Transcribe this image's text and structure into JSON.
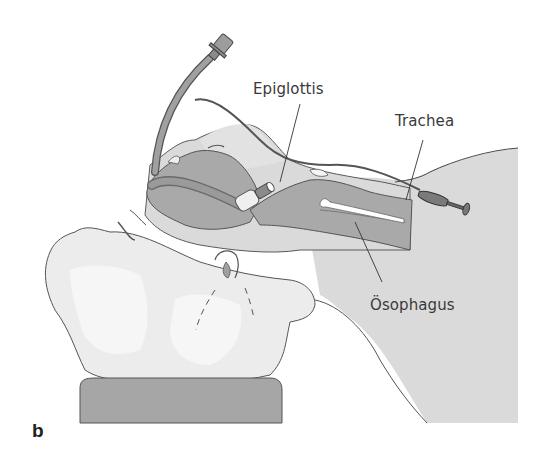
{
  "figure": {
    "panel_letter": "b",
    "labels": {
      "epiglottis": "Epiglottis",
      "trachea": "Trachea",
      "esophagus": "Ösophagus"
    },
    "colors": {
      "background": "#ffffff",
      "body_fill": "#dadada",
      "skin_light": "#ececec",
      "skin_highlight": "#f6f6f6",
      "airway_dark": "#a9a9a9",
      "tube": "#9a9a9a",
      "outline": "#4a4a4a",
      "pillow": "#a6a6a6",
      "text": "#3a3a3a"
    }
  }
}
